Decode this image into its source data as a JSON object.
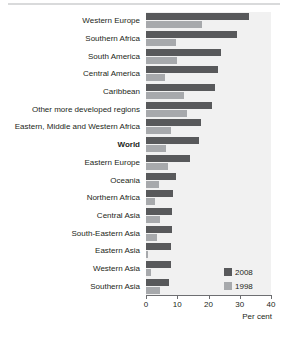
{
  "chart_data": {
    "type": "bar",
    "orientation": "horizontal",
    "title": "",
    "xlabel": "Per cent",
    "ylabel": "",
    "xlim": [
      0,
      40
    ],
    "xticks": [
      0,
      10,
      20,
      30,
      40
    ],
    "xtick_labels": [
      "0",
      "10",
      "20",
      "30",
      "40"
    ],
    "grid": false,
    "legend_position": "bottom-right",
    "categories": [
      "Western Europe",
      "Southern Africa",
      "South America",
      "Central America",
      "Caribbean",
      "Other more developed regions",
      "Eastern, Middle and Western Africa",
      "World",
      "Eastern Europe",
      "Oceania",
      "Northern Africa",
      "Central Asia",
      "South-Eastern Asia",
      "Eastern Asia",
      "Western Asia",
      "Southern Asia"
    ],
    "emphasized_category": "World",
    "series": [
      {
        "name": "2008",
        "color": "#58595b",
        "values": [
          33,
          29,
          24,
          23,
          22,
          21,
          17.5,
          17,
          14,
          9.7,
          8.6,
          8.3,
          8.2,
          8.0,
          7.9,
          7.4
        ]
      },
      {
        "name": "1998",
        "color": "#a7a9ac",
        "values": [
          18,
          9.5,
          10,
          6,
          12,
          13,
          8,
          6.5,
          7,
          4,
          3,
          4.5,
          3.5,
          0.6,
          1.5,
          4.5
        ]
      }
    ]
  },
  "legend": {
    "items": [
      {
        "label": "2008",
        "color": "#58595b"
      },
      {
        "label": "1998",
        "color": "#a7a9ac"
      }
    ]
  },
  "axis": {
    "x_title": "Per cent"
  }
}
